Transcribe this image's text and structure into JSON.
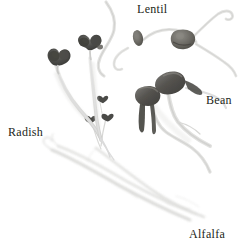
{
  "figure": {
    "kind": "photographic-plate",
    "background_color": "#ffffff",
    "label_color": "#231f20",
    "labels": [
      {
        "name": "lentil",
        "text": "Lentil",
        "position": "top-center"
      },
      {
        "name": "bean",
        "text": "Bean",
        "position": "right-middle"
      },
      {
        "name": "radish",
        "text": "Radish",
        "position": "left-middle"
      },
      {
        "name": "alfalfa",
        "text": "Alfalfa",
        "position": "bottom-right"
      }
    ],
    "specimens": [
      {
        "name": "radish",
        "count": 2,
        "description": "two radish seedlings with dark paired cotyledons on pale arching hypocotyls",
        "cotyledon_color": "#4a4a48",
        "stem_color": "#d8d8d6"
      },
      {
        "name": "lentil",
        "count": 2,
        "description": "two lentil seeds with long curling pale radicles",
        "seed_color": "#6d6b66",
        "stem_color": "#dcdcda"
      },
      {
        "name": "bean",
        "count": 2,
        "description": "two mung bean sprouts with dark oval seed bodies and pale forked roots",
        "seed_color": "#585755",
        "stem_color": "#d4d4d2"
      },
      {
        "name": "alfalfa",
        "count": 3,
        "description": "slender alfalfa sprouts with tiny dark heart-shaped cotyledons and very fine pale stems sweeping to lower right",
        "cotyledon_color": "#3a3a38",
        "stem_color": "#e2e2e0"
      }
    ]
  }
}
